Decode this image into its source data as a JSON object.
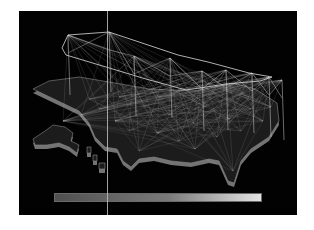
{
  "viewport": {
    "background": "#020202",
    "page_background": "#ffffff"
  },
  "map": {
    "type": "3d-extruded-us-map",
    "fill": "#1c1c1c",
    "edge": "#8a8a8a",
    "extrusion": "#9a9a9a",
    "mainland": [
      [
        14,
        78
      ],
      [
        30,
        70
      ],
      [
        60,
        66
      ],
      [
        96,
        72
      ],
      [
        130,
        78
      ],
      [
        176,
        80
      ],
      [
        214,
        72
      ],
      [
        236,
        78
      ],
      [
        258,
        92
      ],
      [
        260,
        110
      ],
      [
        250,
        126
      ],
      [
        232,
        138
      ],
      [
        222,
        150
      ],
      [
        215,
        172
      ],
      [
        209,
        170
      ],
      [
        200,
        150
      ],
      [
        190,
        148
      ],
      [
        172,
        152
      ],
      [
        152,
        150
      ],
      [
        135,
        146
      ],
      [
        120,
        148
      ],
      [
        112,
        156
      ],
      [
        104,
        150
      ],
      [
        98,
        138
      ],
      [
        86,
        136
      ],
      [
        76,
        126
      ],
      [
        70,
        112
      ],
      [
        60,
        100
      ]
    ],
    "alaska": [
      [
        14,
        128
      ],
      [
        26,
        120
      ],
      [
        34,
        114
      ],
      [
        46,
        116
      ],
      [
        54,
        122
      ],
      [
        52,
        130
      ],
      [
        60,
        134
      ],
      [
        58,
        142
      ],
      [
        50,
        136
      ],
      [
        40,
        132
      ],
      [
        28,
        134
      ],
      [
        16,
        134
      ]
    ],
    "islands": [
      [
        [
          68,
          136
        ],
        [
          72,
          136
        ],
        [
          72,
          142
        ],
        [
          68,
          142
        ]
      ],
      [
        [
          74,
          144
        ],
        [
          78,
          144
        ],
        [
          78,
          150
        ],
        [
          74,
          150
        ]
      ],
      [
        [
          80,
          152
        ],
        [
          86,
          152
        ],
        [
          86,
          158
        ],
        [
          80,
          158
        ]
      ]
    ]
  },
  "network": {
    "line_color": "#d8d8d8",
    "hub_top_ring": [
      [
        49,
        24
      ],
      [
        90,
        21
      ],
      [
        159,
        44
      ],
      [
        189,
        51
      ],
      [
        230,
        62
      ],
      [
        253,
        66
      ],
      [
        241,
        70
      ],
      [
        207,
        73
      ],
      [
        167,
        79
      ],
      [
        127,
        68
      ],
      [
        47,
        44
      ],
      [
        43,
        37
      ]
    ],
    "pillars": [
      [
        49,
        24
      ],
      [
        90,
        21
      ],
      [
        115,
        45
      ],
      [
        151,
        47
      ],
      [
        183,
        60
      ],
      [
        207,
        59
      ],
      [
        233,
        62
      ],
      [
        250,
        66
      ],
      [
        263,
        69
      ]
    ],
    "ground_nodes": [
      [
        44,
        110
      ],
      [
        62,
        104
      ],
      [
        80,
        98
      ],
      [
        96,
        110
      ],
      [
        110,
        120
      ],
      [
        125,
        95
      ],
      [
        138,
        122
      ],
      [
        150,
        104
      ],
      [
        160,
        130
      ],
      [
        174,
        112
      ],
      [
        186,
        96
      ],
      [
        198,
        126
      ],
      [
        210,
        108
      ],
      [
        222,
        120
      ],
      [
        232,
        98
      ],
      [
        244,
        110
      ],
      [
        252,
        96
      ],
      [
        120,
        140
      ],
      [
        176,
        138
      ],
      [
        214,
        160
      ],
      [
        70,
        88
      ],
      [
        100,
        86
      ],
      [
        140,
        86
      ],
      [
        190,
        84
      ],
      [
        230,
        86
      ]
    ]
  },
  "legend": {
    "type": "color-scale",
    "gradient_start": "#505050",
    "gradient_mid": "#7a7a7a",
    "gradient_end": "#e4e4e4",
    "border": "#6a6a6a"
  },
  "cursor": {
    "type": "vertical-slider-line",
    "color": "#bdbdbd",
    "x_px": 88
  }
}
